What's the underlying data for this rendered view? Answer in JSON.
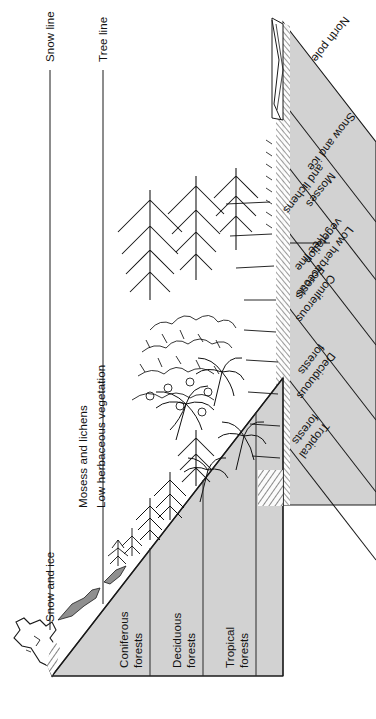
{
  "figure": {
    "type": "diagram",
    "orientation_note": "All labels rendered rotated; sheet appears upside-down",
    "fill_color": "#d2d2d2",
    "line_color": "#1a1a1a"
  },
  "callouts": {
    "snow_line": "Snow line",
    "tree_line": "Tree line",
    "tree_line_right": "Tree line"
  },
  "altitude_zones": [
    {
      "id": "snow-and-ice",
      "label": "Snow and ice"
    },
    {
      "id": "mosses-and-lichens",
      "label": "Mosess and lichens"
    },
    {
      "id": "low-herbaceous-vegetation",
      "label": "Low herbaceous vegetation"
    },
    {
      "id": "coniferous-forests",
      "line1": "Coniferous",
      "line2": "forests"
    },
    {
      "id": "deciduous-forests",
      "line1": "Deciduous",
      "line2": "forests"
    },
    {
      "id": "tropical-forests",
      "line1": "Tropical",
      "line2": "forests"
    }
  ],
  "latitude_zones": [
    {
      "id": "north-pole",
      "label": "North pole"
    },
    {
      "id": "snow-and-ice",
      "label": "Snow and ice"
    },
    {
      "id": "mosses-and-lichens",
      "line1": "Mosses",
      "line2": "and lichens"
    },
    {
      "id": "low-herbaceous-vegetation",
      "line1": "Low herbaceous",
      "line2": "vegetation"
    },
    {
      "id": "coniferous-forests",
      "line1": "Coniferous",
      "line2": "Forests"
    },
    {
      "id": "deciduous-forests",
      "line1": "Deciduous",
      "line2": "forests"
    },
    {
      "id": "tropical-forests",
      "line1": "Tropical",
      "line2": "forests"
    }
  ]
}
